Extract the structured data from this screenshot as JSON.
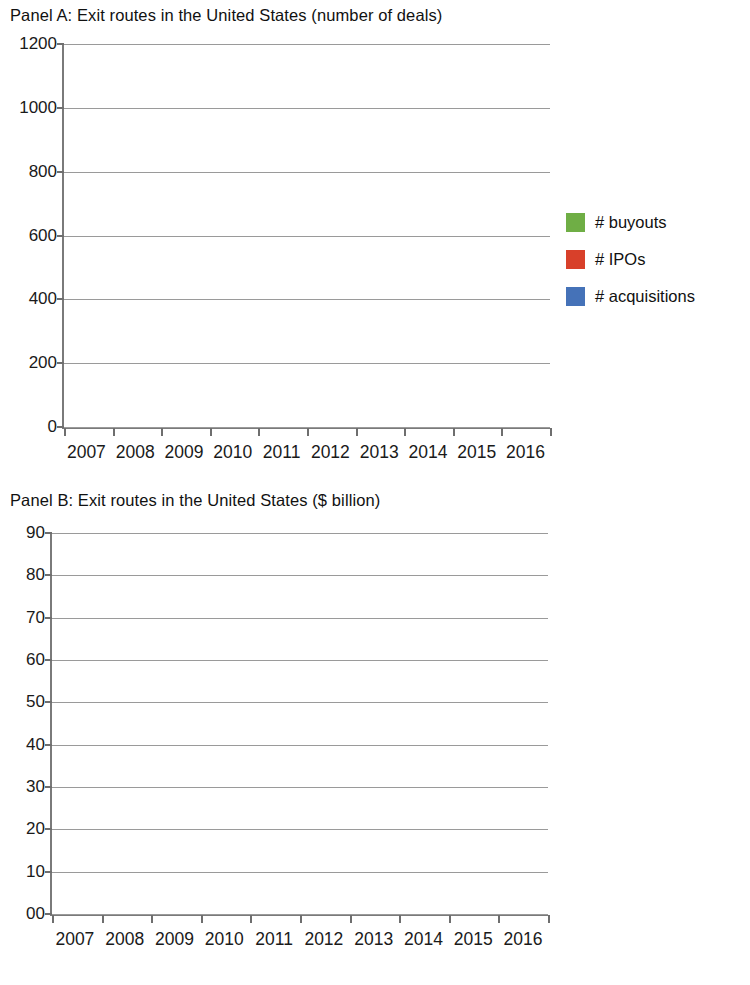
{
  "panels": [
    {
      "id": "panel-a",
      "title": "Panel A: Exit routes in the United States (number of deals)",
      "legend": [
        {
          "label": "# buyouts",
          "color": "#6fae45",
          "key": "buyouts"
        },
        {
          "label": "# IPOs",
          "color": "#d8402a",
          "key": "ipos"
        },
        {
          "label": "# acquisitions",
          "color": "#4572b8",
          "key": "acquisitions"
        }
      ]
    },
    {
      "id": "panel-b",
      "title": "Panel B: Exit routes in the United States ($ billion)",
      "legend": [
        {
          "label": "buyouts ($ bil)",
          "color": "#6fae45",
          "key": "buyouts"
        },
        {
          "label": "IPOs ($ bil)",
          "color": "#d8402a",
          "key": "ipos"
        },
        {
          "label": "acquisitions ($ bil)",
          "color": "#4572b8",
          "key": "acquisitions"
        }
      ]
    }
  ],
  "chart_data": [
    {
      "type": "bar",
      "stacked": true,
      "title": "Panel A: Exit routes in the United States (number of deals)",
      "xlabel": "",
      "ylabel": "",
      "categories": [
        "2007",
        "2008",
        "2009",
        "2010",
        "2011",
        "2012",
        "2013",
        "2014",
        "2015",
        "2016"
      ],
      "ytick_labels": [
        "0",
        "200",
        "400",
        "600",
        "800",
        "1000",
        "1200"
      ],
      "ytick_values": [
        0,
        200,
        400,
        600,
        800,
        1000,
        1200
      ],
      "ylim": [
        0,
        1200
      ],
      "grid": true,
      "legend_position": "right",
      "series": [
        {
          "name": "# acquisitions",
          "color": "#4572b8",
          "values": [
            460,
            418,
            435,
            592,
            625,
            715,
            710,
            785,
            780,
            600
          ]
        },
        {
          "name": "# IPOs",
          "color": "#d8402a",
          "values": [
            85,
            14,
            10,
            40,
            43,
            60,
            90,
            120,
            75,
            25
          ]
        },
        {
          "name": "# buyouts",
          "color": "#6fae45",
          "values": [
            55,
            30,
            35,
            60,
            64,
            85,
            85,
            135,
            107,
            100
          ]
        }
      ],
      "totals": [
        600,
        462,
        480,
        692,
        732,
        860,
        885,
        1040,
        962,
        725
      ]
    },
    {
      "type": "bar",
      "stacked": true,
      "title": "Panel B: Exit routes in the United States ($ billion)",
      "xlabel": "",
      "ylabel": "",
      "categories": [
        "2007",
        "2008",
        "2009",
        "2010",
        "2011",
        "2012",
        "2013",
        "2014",
        "2015",
        "2016"
      ],
      "ytick_labels": [
        "00",
        "10",
        "20",
        "30",
        "40",
        "50",
        "60",
        "70",
        "80",
        "90"
      ],
      "ytick_values": [
        0,
        10,
        20,
        30,
        40,
        50,
        60,
        70,
        80,
        90
      ],
      "ylim": [
        0,
        90
      ],
      "grid": true,
      "legend_position": "right",
      "series": [
        {
          "name": "acquisitions ($ bil)",
          "color": "#4572b8",
          "values": [
            29.8,
            15.5,
            14.0,
            24.0,
            28.0,
            30.0,
            25.0,
            68.5,
            37.0,
            42.5
          ]
        },
        {
          "name": "IPOs ($ bil)",
          "color": "#d8402a",
          "values": [
            7.2,
            1.0,
            1.0,
            3.0,
            6.5,
            21.5,
            9.5,
            11.0,
            8.5,
            3.0
          ]
        },
        {
          "name": "buyouts ($ bil)",
          "color": "#6fae45",
          "values": [
            3.5,
            1.8,
            0.8,
            3.0,
            2.3,
            2.5,
            2.0,
            2.5,
            5.0,
            1.5
          ]
        }
      ],
      "totals": [
        40.5,
        18.3,
        15.8,
        30.0,
        36.8,
        54.0,
        36.5,
        82.0,
        50.5,
        47.0
      ]
    }
  ]
}
